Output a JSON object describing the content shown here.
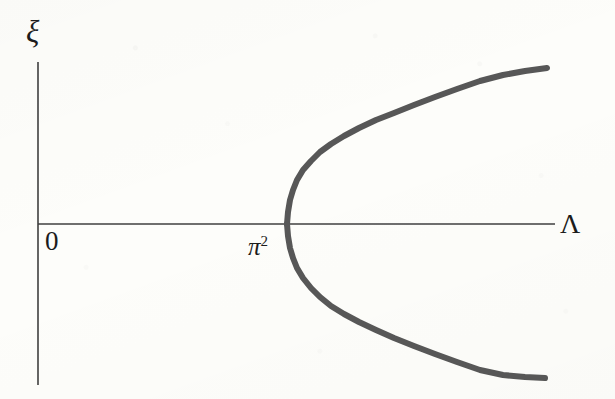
{
  "figure": {
    "kind": "bifurcation-diagram",
    "width": 615,
    "height": 399,
    "background_color": "#fdfdfa"
  },
  "labels": {
    "y_axis": "ξ",
    "x_axis": "Λ",
    "origin": "0",
    "critical_point_base": "π",
    "critical_point_exponent": "2"
  },
  "chart_data": {
    "type": "line",
    "title": "",
    "xlabel": "Λ",
    "ylabel": "ξ",
    "grid": false,
    "legend": null,
    "annotations": [
      {
        "text": "0",
        "role": "origin-tick",
        "x_px": 50,
        "y_px": 243
      },
      {
        "text": "π²",
        "role": "bifurcation-point-tick",
        "x_px": 258,
        "y_px": 249
      }
    ],
    "axes": {
      "x_axis_line": {
        "x_start_px": 38,
        "x_end_px": 555,
        "y_px": 224
      },
      "y_axis_line": {
        "y_start_px": 62,
        "y_end_px": 385,
        "x_px": 38
      },
      "origin_px": [
        38,
        224
      ],
      "arrowheads": false,
      "ticks": []
    },
    "series": [
      {
        "name": "upper branch",
        "color": "#575757",
        "linewidth_px": 6,
        "points_px": [
          [
            287,
            224
          ],
          [
            288,
            212
          ],
          [
            290,
            200
          ],
          [
            293,
            190
          ],
          [
            297,
            180
          ],
          [
            303,
            170
          ],
          [
            311,
            161
          ],
          [
            320,
            152
          ],
          [
            331,
            144
          ],
          [
            344,
            136
          ],
          [
            359,
            128
          ],
          [
            376,
            120
          ],
          [
            394,
            113
          ],
          [
            414,
            105
          ],
          [
            435,
            97
          ],
          [
            457,
            89
          ],
          [
            480,
            81
          ],
          [
            503,
            75
          ],
          [
            525,
            71
          ],
          [
            547,
            68
          ]
        ]
      },
      {
        "name": "lower branch",
        "color": "#575757",
        "linewidth_px": 6,
        "points_px": [
          [
            287,
            224
          ],
          [
            288,
            236
          ],
          [
            290,
            248
          ],
          [
            293,
            258
          ],
          [
            297,
            268
          ],
          [
            303,
            278
          ],
          [
            311,
            288
          ],
          [
            320,
            297
          ],
          [
            331,
            306
          ],
          [
            344,
            314
          ],
          [
            359,
            322
          ],
          [
            376,
            330
          ],
          [
            394,
            338
          ],
          [
            414,
            346
          ],
          [
            435,
            354
          ],
          [
            457,
            362
          ],
          [
            480,
            370
          ],
          [
            503,
            375
          ],
          [
            525,
            377
          ],
          [
            545,
            378
          ]
        ]
      }
    ],
    "curve_description": "sideways parabola opening to the right, vertex on the Λ axis at Λ = π²",
    "vertex_px": [
      287,
      224
    ],
    "vertex_value": {
      "x": "π²",
      "y": 0
    }
  },
  "style": {
    "axis_color": "#3f3f3f",
    "axis_width_px": 1.6,
    "curve_color": "#575757",
    "curve_width_px": 6,
    "text_color": "#1c1c1c"
  }
}
